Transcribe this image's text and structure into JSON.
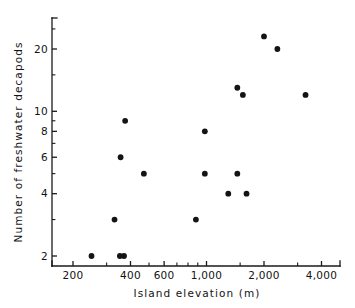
{
  "chart_data": {
    "type": "scatter",
    "title": "",
    "xlabel": "Island  elevation  (m)",
    "ylabel": "Number  of  freshwater  decapods",
    "xscale": "log",
    "yscale": "log",
    "xlim": [
      180,
      4400
    ],
    "ylim": [
      1.85,
      26
    ],
    "grid": false,
    "legend": null,
    "xticks": [
      {
        "value": 200,
        "label": "200"
      },
      {
        "value": 400,
        "label": "400"
      },
      {
        "value": 600,
        "label": "600"
      },
      {
        "value": 1000,
        "label": "1,000"
      },
      {
        "value": 2000,
        "label": "2,000"
      },
      {
        "value": 4000,
        "label": "4,000"
      }
    ],
    "xticks_minor": [
      300,
      500,
      700,
      800,
      900,
      1500,
      3000
    ],
    "yticks": [
      {
        "value": 2,
        "label": "2"
      },
      {
        "value": 4,
        "label": "4"
      },
      {
        "value": 6,
        "label": "6"
      },
      {
        "value": 8,
        "label": "8"
      },
      {
        "value": 10,
        "label": "10"
      },
      {
        "value": 20,
        "label": "20"
      }
    ],
    "yticks_minor": [
      3,
      5,
      7,
      9,
      15,
      25
    ],
    "points": [
      {
        "x": 250,
        "y": 2
      },
      {
        "x": 352,
        "y": 2
      },
      {
        "x": 370,
        "y": 2
      },
      {
        "x": 330,
        "y": 3
      },
      {
        "x": 355,
        "y": 6
      },
      {
        "x": 375,
        "y": 9
      },
      {
        "x": 470,
        "y": 5
      },
      {
        "x": 880,
        "y": 3
      },
      {
        "x": 980,
        "y": 8
      },
      {
        "x": 980,
        "y": 5
      },
      {
        "x": 1300,
        "y": 4
      },
      {
        "x": 1450,
        "y": 5
      },
      {
        "x": 1450,
        "y": 13
      },
      {
        "x": 1550,
        "y": 12
      },
      {
        "x": 1620,
        "y": 4
      },
      {
        "x": 2000,
        "y": 23
      },
      {
        "x": 2350,
        "y": 20
      },
      {
        "x": 3300,
        "y": 12
      }
    ],
    "colors": {
      "point": "#141414",
      "axis": "#1a1a1a",
      "text": "#131313",
      "background": "#ffffff"
    }
  }
}
